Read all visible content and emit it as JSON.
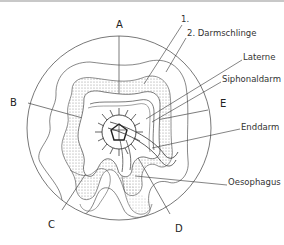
{
  "figure": {
    "sectors": {
      "A": "A",
      "B": "B",
      "C": "C",
      "D": "D",
      "E": "E"
    },
    "annotations": {
      "loop1": "1.",
      "loop2": "2. Darmschlinge",
      "lantern": "Laterne",
      "siphonal": "Siphonaldarm",
      "rectum": "Enddarm",
      "oesophagus": "Oesophagus"
    },
    "colors": {
      "line": "#333333",
      "stipple": "#9a9a9a",
      "background": "#ffffff"
    }
  }
}
